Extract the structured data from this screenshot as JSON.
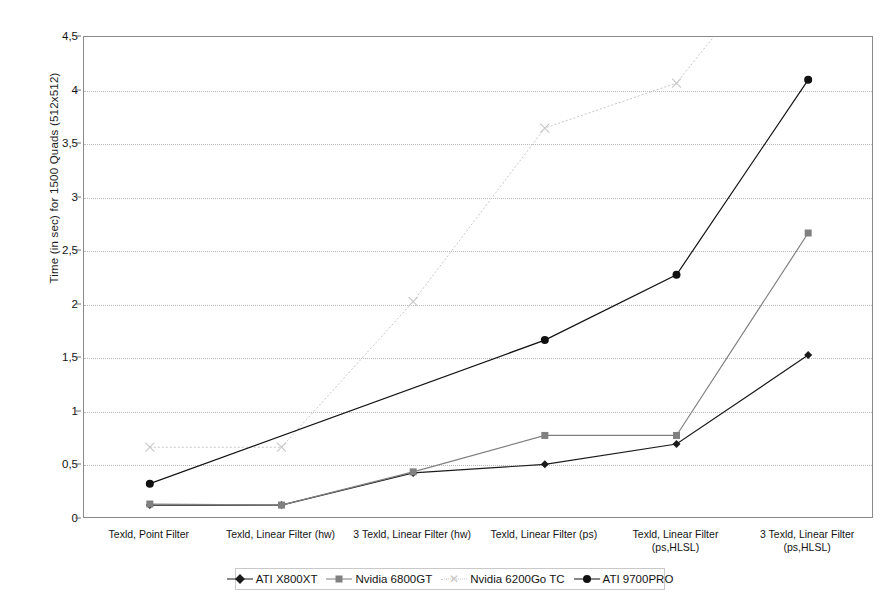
{
  "chart_data": {
    "type": "line",
    "title": "",
    "xlabel": "",
    "ylabel": "Time (in sec) for 1500 Quads (512x512)",
    "ylim": [
      0,
      4.5
    ],
    "ytick_labels": [
      "0",
      "0,5",
      "1",
      "1,5",
      "2",
      "2,5",
      "3",
      "3,5",
      "4",
      "4,5"
    ],
    "ytick_values": [
      0,
      0.5,
      1,
      1.5,
      2,
      2.5,
      3,
      3.5,
      4,
      4.5
    ],
    "grid": true,
    "legend_position": "bottom",
    "categories": [
      "Texld, Point Filter",
      "Texld, Linear Filter (hw)",
      "3 Texld, Linear Filter (hw)",
      "Texld, Linear Filter (ps)",
      "Texld, Linear Filter\n(ps,HLSL)",
      "3 Texld, Linear Filter\n(ps,HLSL)"
    ],
    "series": [
      {
        "name": "ATI X800XT",
        "marker": "diamond",
        "color": "#1b1b1b",
        "values": [
          0.13,
          0.13,
          0.43,
          0.51,
          0.7,
          1.53
        ]
      },
      {
        "name": "Nvidia 6800GT",
        "marker": "square",
        "color": "#808080",
        "values": [
          0.14,
          0.13,
          0.44,
          0.78,
          0.78,
          2.67
        ]
      },
      {
        "name": "Nvidia 6200Go TC",
        "marker": "x",
        "color": "#c7c7c7",
        "values": [
          0.67,
          0.67,
          2.03,
          3.65,
          4.07,
          5.6
        ]
      },
      {
        "name": "ATI 9700PRO",
        "marker": "circle",
        "color": "#111111",
        "values": [
          0.33,
          null,
          null,
          1.67,
          2.28,
          4.1
        ]
      }
    ]
  }
}
